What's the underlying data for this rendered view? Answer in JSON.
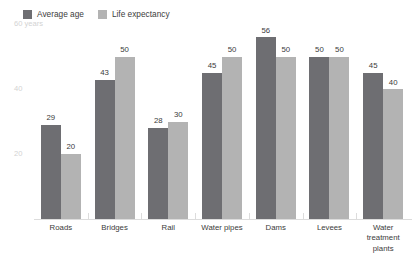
{
  "legend": {
    "position": "top-left",
    "items": [
      {
        "label": "Average age",
        "color": "#6e6e72"
      },
      {
        "label": "Life expectancy",
        "color": "#b3b3b3"
      }
    ]
  },
  "y_axis": {
    "ticks": [
      {
        "label": "60 years",
        "value": 60
      },
      {
        "label": "40",
        "value": 40
      },
      {
        "label": "20",
        "value": 20
      }
    ],
    "color": "#d3d3d3"
  },
  "chart_data": {
    "type": "bar",
    "title": "",
    "subtitle": "",
    "xlabel": "",
    "ylabel": "60 years",
    "ylim": [
      0,
      62
    ],
    "grid": false,
    "legend_position": "top-left",
    "categories": [
      "Roads",
      "Bridges",
      "Rail",
      "Water pipes",
      "Dams",
      "Levees",
      "Water treatment plants"
    ],
    "series": [
      {
        "name": "Average age",
        "color": "#6e6e72",
        "values": [
          29,
          43,
          28,
          45,
          56,
          50,
          45
        ]
      },
      {
        "name": "Life expectancy",
        "color": "#b3b3b3",
        "values": [
          20,
          50,
          30,
          50,
          50,
          50,
          40
        ]
      }
    ],
    "tick_labels": {
      "y": [
        "60 years",
        "40",
        "20"
      ]
    },
    "annotations": []
  }
}
